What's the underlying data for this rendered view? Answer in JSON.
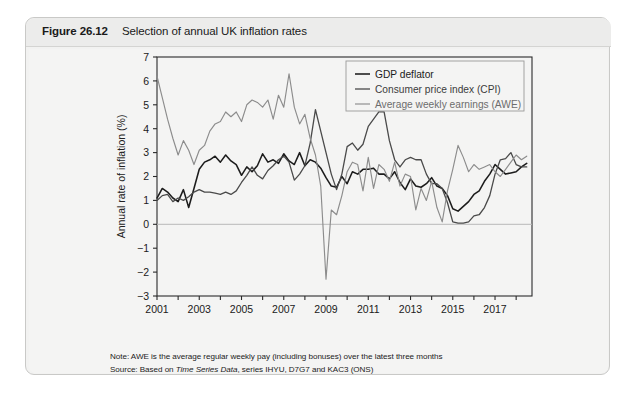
{
  "figure": {
    "number": "Figure 26.12",
    "caption": "Selection of annual UK inflation rates"
  },
  "notes": {
    "note_prefix": "Note: AWE is the average regular weekly pay (including bonuses) over the latest three months",
    "source_prefix": "Source: Based on ",
    "source_italic": "Time Series Data",
    "source_suffix": ", series IHYU, D7G7 and KAC3 (ONS)"
  },
  "colors": {
    "gdp_deflator": "#1c1c1c",
    "cpi": "#4a4a4a",
    "awe": "#8c8c8c",
    "axis": "#2a2a2a",
    "gridline": "#b8b8b8",
    "panel_bg": "#f4f4f3",
    "header_bg": "#ececeb",
    "legend_border": "#9a9a9a"
  },
  "chart_data": {
    "type": "line",
    "title": "Selection of annual UK inflation rates",
    "xlabel": "",
    "ylabel": "Annual rate of inflation (%)",
    "xlim": [
      2001.0,
      2018.75
    ],
    "ylim": [
      -3,
      7
    ],
    "yticks": [
      -3,
      -2,
      -1,
      0,
      1,
      2,
      3,
      4,
      5,
      6,
      7
    ],
    "ytick_labels": [
      "−3",
      "−2",
      "−1",
      "0",
      "1",
      "2",
      "3",
      "4",
      "5",
      "6",
      "7"
    ],
    "xticks": [
      2001,
      2003,
      2005,
      2007,
      2009,
      2011,
      2013,
      2015,
      2017
    ],
    "xtick_labels": [
      "2001",
      "2003",
      "2005",
      "2007",
      "2009",
      "2011",
      "2013",
      "2015",
      "2017"
    ],
    "x_minor_step": 1,
    "grid": "zero-line-only",
    "legend_position": "top-right",
    "series": [
      {
        "name": "GDP deflator",
        "color_key": "gdp_deflator",
        "x": [
          2001.0,
          2001.25,
          2001.5,
          2001.75,
          2002.0,
          2002.25,
          2002.5,
          2002.75,
          2003.0,
          2003.25,
          2003.5,
          2003.75,
          2004.0,
          2004.25,
          2004.5,
          2004.75,
          2005.0,
          2005.25,
          2005.5,
          2005.75,
          2006.0,
          2006.25,
          2006.5,
          2006.75,
          2007.0,
          2007.25,
          2007.5,
          2007.75,
          2008.0,
          2008.25,
          2008.5,
          2008.75,
          2009.0,
          2009.25,
          2009.5,
          2009.75,
          2010.0,
          2010.25,
          2010.5,
          2010.75,
          2011.0,
          2011.25,
          2011.5,
          2011.75,
          2012.0,
          2012.25,
          2012.5,
          2012.75,
          2013.0,
          2013.25,
          2013.5,
          2013.75,
          2014.0,
          2014.25,
          2014.5,
          2014.75,
          2015.0,
          2015.25,
          2015.5,
          2015.75,
          2016.0,
          2016.25,
          2016.5,
          2016.75,
          2017.0,
          2017.25,
          2017.5,
          2017.75,
          2018.0,
          2018.25,
          2018.5
        ],
        "y": [
          1.1,
          1.5,
          1.35,
          1.1,
          0.95,
          1.45,
          0.7,
          1.5,
          2.3,
          2.6,
          2.7,
          2.85,
          2.6,
          2.9,
          2.65,
          2.5,
          2.05,
          2.4,
          2.2,
          2.45,
          2.95,
          2.6,
          2.7,
          2.55,
          2.95,
          2.65,
          2.5,
          3.0,
          2.45,
          2.7,
          2.6,
          2.35,
          1.95,
          1.6,
          1.55,
          2.0,
          1.7,
          2.2,
          2.1,
          2.3,
          2.3,
          2.35,
          2.1,
          2.1,
          1.9,
          2.2,
          1.75,
          1.45,
          1.9,
          1.6,
          1.55,
          1.7,
          1.95,
          1.6,
          1.5,
          1.2,
          0.65,
          0.55,
          0.75,
          0.95,
          1.25,
          1.4,
          1.8,
          2.1,
          2.5,
          2.3,
          2.1,
          2.15,
          2.2,
          2.4,
          2.55
        ]
      },
      {
        "name": "Consumer price index (CPI)",
        "color_key": "cpi",
        "x": [
          2001.0,
          2001.25,
          2001.5,
          2001.75,
          2002.0,
          2002.25,
          2002.5,
          2002.75,
          2003.0,
          2003.25,
          2003.5,
          2003.75,
          2004.0,
          2004.25,
          2004.5,
          2004.75,
          2005.0,
          2005.25,
          2005.5,
          2005.75,
          2006.0,
          2006.25,
          2006.5,
          2006.75,
          2007.0,
          2007.25,
          2007.5,
          2007.75,
          2008.0,
          2008.25,
          2008.5,
          2008.75,
          2009.0,
          2009.25,
          2009.5,
          2009.75,
          2010.0,
          2010.25,
          2010.5,
          2010.75,
          2011.0,
          2011.25,
          2011.5,
          2011.75,
          2012.0,
          2012.25,
          2012.5,
          2012.75,
          2013.0,
          2013.25,
          2013.5,
          2013.75,
          2014.0,
          2014.25,
          2014.5,
          2014.75,
          2015.0,
          2015.25,
          2015.5,
          2015.75,
          2016.0,
          2016.25,
          2016.5,
          2016.75,
          2017.0,
          2017.25,
          2017.5,
          2017.75,
          2018.0,
          2018.25,
          2018.5
        ],
        "y": [
          1.0,
          1.2,
          1.25,
          0.95,
          1.1,
          1.0,
          1.15,
          1.35,
          1.45,
          1.35,
          1.35,
          1.3,
          1.25,
          1.35,
          1.25,
          1.4,
          1.75,
          2.05,
          2.4,
          2.05,
          1.9,
          2.25,
          2.45,
          2.7,
          2.85,
          2.6,
          1.85,
          2.1,
          2.45,
          3.4,
          4.8,
          3.9,
          3.0,
          2.1,
          1.45,
          2.1,
          3.25,
          3.4,
          3.1,
          3.35,
          4.1,
          4.4,
          4.7,
          4.7,
          3.5,
          2.7,
          2.4,
          2.7,
          2.8,
          2.7,
          2.7,
          2.1,
          1.7,
          1.7,
          1.5,
          0.9,
          0.1,
          0.05,
          0.05,
          0.1,
          0.35,
          0.4,
          0.7,
          1.2,
          2.1,
          2.7,
          2.75,
          3.0,
          2.5,
          2.4,
          2.4
        ]
      },
      {
        "name": "Average weekly earnings (AWE)",
        "color_key": "awe",
        "x": [
          2001.0,
          2001.25,
          2001.5,
          2001.75,
          2002.0,
          2002.25,
          2002.5,
          2002.75,
          2003.0,
          2003.25,
          2003.5,
          2003.75,
          2004.0,
          2004.25,
          2004.5,
          2004.75,
          2005.0,
          2005.25,
          2005.5,
          2005.75,
          2006.0,
          2006.25,
          2006.5,
          2006.75,
          2007.0,
          2007.25,
          2007.5,
          2007.75,
          2008.0,
          2008.25,
          2008.5,
          2008.75,
          2009.0,
          2009.25,
          2009.5,
          2009.75,
          2010.0,
          2010.25,
          2010.5,
          2010.75,
          2011.0,
          2011.25,
          2011.5,
          2011.75,
          2012.0,
          2012.25,
          2012.5,
          2012.75,
          2013.0,
          2013.25,
          2013.5,
          2013.75,
          2014.0,
          2014.25,
          2014.5,
          2014.75,
          2015.0,
          2015.25,
          2015.5,
          2015.75,
          2016.0,
          2016.25,
          2016.5,
          2016.75,
          2017.0,
          2017.25,
          2017.5,
          2017.75,
          2018.0,
          2018.25,
          2018.5
        ],
        "y": [
          6.2,
          5.3,
          4.4,
          3.6,
          2.9,
          3.5,
          3.1,
          2.5,
          3.1,
          3.3,
          3.9,
          4.2,
          4.3,
          4.7,
          4.5,
          4.7,
          4.3,
          5.0,
          5.2,
          5.1,
          4.9,
          5.2,
          4.4,
          5.4,
          4.9,
          6.3,
          4.9,
          4.2,
          4.6,
          3.6,
          2.9,
          1.6,
          -2.3,
          0.6,
          0.4,
          1.2,
          2.2,
          2.6,
          2.5,
          1.4,
          2.8,
          1.5,
          2.5,
          2.3,
          1.8,
          2.6,
          1.6,
          2.1,
          2.0,
          0.6,
          1.5,
          1.0,
          1.8,
          0.7,
          0.1,
          1.4,
          2.3,
          3.3,
          2.8,
          2.2,
          2.5,
          2.3,
          2.4,
          2.5,
          2.2,
          2.0,
          2.3,
          2.6,
          2.9,
          2.7,
          2.85
        ]
      }
    ]
  }
}
